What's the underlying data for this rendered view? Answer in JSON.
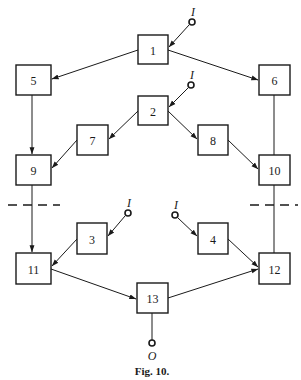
{
  "figure": {
    "caption": "Fig. 10.",
    "colors": {
      "ink": "#1a1a1a",
      "background": "#ffffff"
    }
  },
  "nodes": [
    {
      "id": "1",
      "label": "1",
      "x": 138,
      "y": 35,
      "w": 30,
      "h": 29
    },
    {
      "id": "2",
      "label": "2",
      "x": 138,
      "y": 96,
      "w": 30,
      "h": 29
    },
    {
      "id": "3",
      "label": "3",
      "x": 77,
      "y": 223,
      "w": 30,
      "h": 31
    },
    {
      "id": "4",
      "label": "4",
      "x": 198,
      "y": 223,
      "w": 30,
      "h": 31
    },
    {
      "id": "5",
      "label": "5",
      "x": 16,
      "y": 65,
      "w": 35,
      "h": 30
    },
    {
      "id": "6",
      "label": "6",
      "x": 259,
      "y": 65,
      "w": 31,
      "h": 30
    },
    {
      "id": "7",
      "label": "7",
      "x": 77,
      "y": 125,
      "w": 31,
      "h": 30
    },
    {
      "id": "8",
      "label": "8",
      "x": 198,
      "y": 125,
      "w": 30,
      "h": 30
    },
    {
      "id": "9",
      "label": "9",
      "x": 16,
      "y": 155,
      "w": 35,
      "h": 30
    },
    {
      "id": "10",
      "label": "10",
      "x": 259,
      "y": 155,
      "w": 31,
      "h": 30
    },
    {
      "id": "11",
      "label": "11",
      "x": 16,
      "y": 253,
      "w": 35,
      "h": 31
    },
    {
      "id": "12",
      "label": "12",
      "x": 259,
      "y": 253,
      "w": 31,
      "h": 31
    },
    {
      "id": "13",
      "label": "13",
      "x": 137,
      "y": 283,
      "w": 31,
      "h": 30
    }
  ],
  "inputs": [
    {
      "label": "I",
      "target": "1",
      "cx": 192,
      "cy": 22
    },
    {
      "label": "I",
      "target": "2",
      "cx": 191,
      "cy": 85
    },
    {
      "label": "I",
      "target": "3",
      "cx": 128,
      "cy": 213
    },
    {
      "label": "I",
      "target": "4",
      "cx": 175,
      "cy": 215
    }
  ],
  "output": {
    "label": "O",
    "source": "13",
    "cx": 152,
    "cy": 343
  },
  "edges": [
    {
      "from": "1",
      "to": "5",
      "arrow": true
    },
    {
      "from": "1",
      "to": "6",
      "arrow": true
    },
    {
      "from": "2",
      "to": "7",
      "arrow": true
    },
    {
      "from": "2",
      "to": "8",
      "arrow": true
    },
    {
      "from": "5",
      "to": "9",
      "arrow": true
    },
    {
      "from": "7",
      "to": "9",
      "arrow": true
    },
    {
      "from": "8",
      "to": "10",
      "arrow": true
    },
    {
      "from": "6",
      "to": "10",
      "arrow": false
    },
    {
      "from": "9",
      "to": "11",
      "arrow": true
    },
    {
      "from": "3",
      "to": "11",
      "arrow": true
    },
    {
      "from": "10",
      "to": "12",
      "arrow": false
    },
    {
      "from": "4",
      "to": "12",
      "arrow": true
    },
    {
      "from": "11",
      "to": "13",
      "arrow": true
    },
    {
      "from": "13",
      "to": "12",
      "arrow": true
    }
  ],
  "cut_lines": [
    {
      "x1": 8,
      "x2": 60,
      "y": 205
    },
    {
      "x1": 250,
      "x2": 298,
      "y": 205
    }
  ]
}
